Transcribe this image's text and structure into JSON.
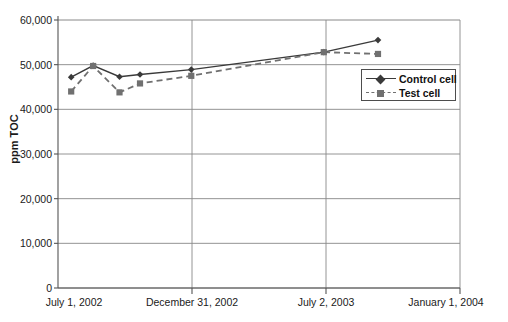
{
  "chart_data": {
    "type": "line",
    "title": "",
    "subtitle": "",
    "xlabel": "",
    "ylabel": "ppm TOC",
    "ylim": [
      0,
      60000
    ],
    "ytick_values": [
      0,
      10000,
      20000,
      30000,
      40000,
      50000,
      60000
    ],
    "ytick_labels": [
      "0",
      "10,000",
      "20,000",
      "30,000",
      "40,000",
      "50,000",
      "60,000"
    ],
    "grid": "horizontal-and-vertical",
    "legend_position": "inside-right-upper",
    "x_axis_tick_labels": [
      "July 1, 2002",
      "December 31, 2002",
      "July 2, 2003",
      "January 1, 2004"
    ],
    "x_axis_tick_positions": [
      0,
      183,
      366,
      549
    ],
    "x_unit": "days since July 1, 2002",
    "xlim": [
      0,
      549
    ],
    "series": [
      {
        "name": "Control cell",
        "marker": "diamond",
        "line_style": "solid",
        "color": "#3a3a3a",
        "x": [
          18,
          48,
          84,
          112,
          182,
          363,
          437
        ],
        "y": [
          47200,
          49800,
          47300,
          47800,
          48900,
          52800,
          55500
        ]
      },
      {
        "name": "Test cell",
        "marker": "square",
        "line_style": "dashed",
        "color": "#707070",
        "x": [
          18,
          48,
          84,
          112,
          182,
          363,
          437
        ],
        "y": [
          44000,
          49700,
          43800,
          45800,
          47500,
          52800,
          52400
        ]
      }
    ]
  },
  "legend": {
    "entries": [
      {
        "label": "Control cell",
        "marker": "diamond-marker-icon"
      },
      {
        "label": "Test cell",
        "marker": "square-marker-icon"
      }
    ]
  },
  "axes": {
    "y_title": "ppm TOC",
    "y_labels": [
      "60,000",
      "50,000",
      "40,000",
      "30,000",
      "20,000",
      "10,000",
      "0"
    ],
    "x_labels": [
      "July 1, 2002",
      "December 31, 2002",
      "July 2, 2003",
      "January 1, 2004"
    ]
  },
  "colors": {
    "control_series": "#3a3a3a",
    "test_series": "#707070",
    "grid": "#888888",
    "axis": "#555555",
    "text": "#1a1a1a",
    "background": "#ffffff"
  }
}
